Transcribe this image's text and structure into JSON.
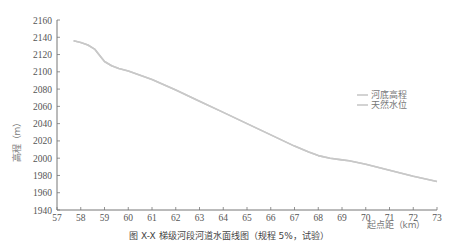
{
  "chart_data": {
    "type": "line",
    "title": "",
    "caption": "图 X-X  梯级河段河道水面线图（规程 5%，试验）",
    "xlabel": "起点距（km）",
    "ylabel": "高程（m）",
    "xlim": [
      57,
      73
    ],
    "ylim": [
      1940,
      2160
    ],
    "x_ticks": [
      57,
      58,
      59,
      60,
      61,
      62,
      63,
      64,
      65,
      66,
      67,
      68,
      69,
      70,
      71,
      72,
      73
    ],
    "y_ticks": [
      1940,
      1960,
      1980,
      2000,
      2020,
      2040,
      2060,
      2080,
      2100,
      2120,
      2140,
      2160
    ],
    "grid": false,
    "legend_position": "right",
    "series": [
      {
        "name": "河底高程",
        "color": "#c8c8c8",
        "x": [
          57.7,
          58.0,
          58.3,
          58.6,
          58.8,
          59.0,
          59.3,
          59.6,
          60.0,
          61.0,
          62.0,
          63.0,
          64.0,
          65.0,
          66.0,
          67.0,
          67.6,
          68.0,
          68.5,
          69.0,
          69.3,
          70.0,
          71.0,
          72.0,
          73.0
        ],
        "y": [
          2136,
          2134,
          2131,
          2126,
          2119,
          2112,
          2107,
          2104,
          2101,
          2091,
          2079,
          2066,
          2053,
          2040,
          2027,
          2014,
          2007,
          2003,
          2000,
          1998,
          1997,
          1993,
          1986,
          1979,
          1973
        ]
      },
      {
        "name": "天然水位",
        "color": "#c8c8c8",
        "x": [
          57.7,
          58.0,
          58.3,
          58.6,
          58.8,
          59.0,
          59.3,
          59.6,
          60.0,
          61.0,
          62.0,
          63.0,
          64.0,
          65.0,
          66.0,
          67.0,
          67.6,
          68.0,
          68.5,
          69.0,
          69.3,
          70.0,
          71.0,
          72.0,
          73.0
        ],
        "y": [
          2136,
          2134,
          2131,
          2126,
          2119,
          2112,
          2107,
          2104,
          2101,
          2091,
          2079,
          2066,
          2053,
          2040,
          2027,
          2014,
          2007,
          2003,
          2000,
          1998,
          1997,
          1993,
          1986,
          1979,
          1973
        ]
      }
    ]
  },
  "legend": {
    "items": [
      {
        "label": "河底高程"
      },
      {
        "label": "天然水位"
      }
    ]
  },
  "axes": {
    "ylabel": "高程（m）",
    "xlabel": "起点距（km）"
  },
  "caption": "图 X-X  梯级河段河道水面线图（规程 5%，试验）"
}
